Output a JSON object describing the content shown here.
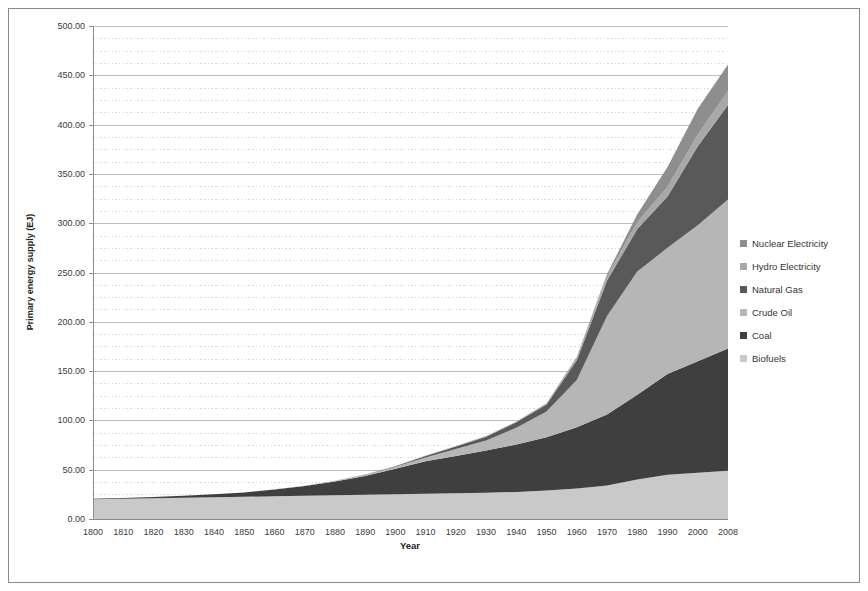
{
  "chart_data": {
    "type": "area",
    "stacked": true,
    "xlabel": "Year",
    "ylabel": "Primary energy supply (EJ)",
    "ylim": [
      0,
      500
    ],
    "y_major_step": 50,
    "y_minor_step": 12.5,
    "y_tick_labels": [
      "0.00",
      "50.00",
      "100.00",
      "150.00",
      "200.00",
      "250.00",
      "300.00",
      "350.00",
      "400.00",
      "450.00",
      "500.00"
    ],
    "grid": "major solid, minor dotted",
    "legend_position": "right",
    "legend_order_top_to_bottom": [
      "Nuclear Electricity",
      "Hydro Electricity",
      "Natural Gas",
      "Crude Oil",
      "Coal",
      "Biofuels"
    ],
    "categories": [
      "1800",
      "1810",
      "1820",
      "1830",
      "1840",
      "1850",
      "1860",
      "1870",
      "1880",
      "1890",
      "1900",
      "1910",
      "1920",
      "1930",
      "1940",
      "1950",
      "1960",
      "1970",
      "1980",
      "1990",
      "2000",
      "2008"
    ],
    "series": [
      {
        "name": "Biofuels",
        "color": "#c9c9c9",
        "values": [
          20,
          20.5,
          21,
          21.5,
          22,
          22.5,
          23,
          23.5,
          24,
          24.5,
          25,
          25.5,
          26,
          26.5,
          27.5,
          29,
          31,
          34,
          40,
          45,
          47,
          49
        ]
      },
      {
        "name": "Coal",
        "color": "#3f3f3f",
        "values": [
          0.5,
          0.8,
          1.2,
          2,
          3,
          4.5,
          7,
          10,
          14,
          19,
          26,
          33,
          38,
          43,
          48,
          54,
          62,
          72,
          86,
          102,
          113,
          124
        ]
      },
      {
        "name": "Crude Oil",
        "color": "#b6b6b6",
        "values": [
          0,
          0,
          0,
          0,
          0,
          0,
          0.1,
          0.3,
          0.7,
          1.2,
          2,
          4,
          7,
          10,
          17,
          26,
          48,
          100,
          125,
          128,
          138,
          151
        ]
      },
      {
        "name": "Natural Gas",
        "color": "#595959",
        "values": [
          0,
          0,
          0,
          0,
          0,
          0,
          0,
          0,
          0.1,
          0.3,
          0.5,
          1.5,
          2.5,
          4,
          5.5,
          7,
          20,
          36,
          43,
          52,
          80,
          96
        ]
      },
      {
        "name": "Hydro Electricity",
        "color": "#a8a8a8",
        "values": [
          0,
          0,
          0,
          0,
          0,
          0,
          0,
          0,
          0,
          0.1,
          0.2,
          0.3,
          0.5,
          0.7,
          1,
          1.5,
          3,
          4.5,
          7,
          10,
          12,
          14
        ]
      },
      {
        "name": "Nuclear Electricity",
        "color": "#8e8e8e",
        "values": [
          0,
          0,
          0,
          0,
          0,
          0,
          0,
          0,
          0,
          0,
          0,
          0,
          0,
          0,
          0,
          0,
          0.5,
          2,
          8,
          20,
          26,
          27
        ]
      }
    ],
    "colors": {
      "grid_major": "#bdbdbd",
      "grid_minor": "#d8d8d8",
      "axis_line": "#8c8c8c",
      "figure_border": "#8a8a8a"
    }
  }
}
